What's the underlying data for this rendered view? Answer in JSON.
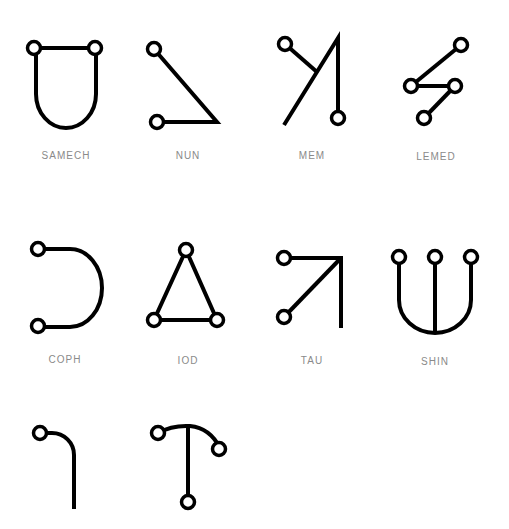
{
  "glyphs": [
    {
      "name": "SAMECH",
      "label_x": 66,
      "label_y": 150
    },
    {
      "name": "NUN",
      "label_x": 188,
      "label_y": 150
    },
    {
      "name": "MEM",
      "label_x": 312,
      "label_y": 150
    },
    {
      "name": "LEMED",
      "label_x": 436,
      "label_y": 151
    },
    {
      "name": "COPH",
      "label_x": 65,
      "label_y": 354
    },
    {
      "name": "IOD",
      "label_x": 188,
      "label_y": 355
    },
    {
      "name": "TAU",
      "label_x": 312,
      "label_y": 355
    },
    {
      "name": "SHIN",
      "label_x": 435,
      "label_y": 356
    },
    {
      "name": "",
      "label_x": 0,
      "label_y": 0
    },
    {
      "name": "",
      "label_x": 0,
      "label_y": 0
    }
  ],
  "colors": {
    "stroke": "#000000",
    "label": "#8a8a8a",
    "background": "#ffffff"
  }
}
